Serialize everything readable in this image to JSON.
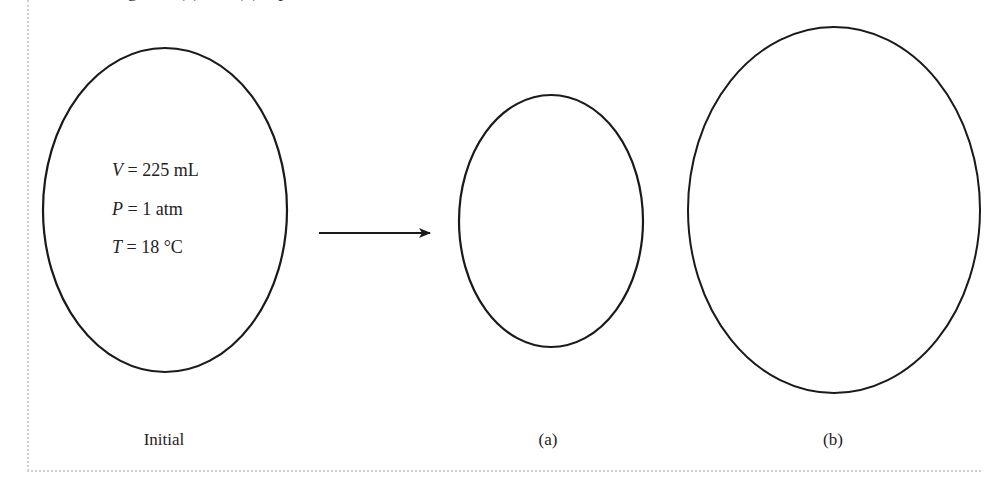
{
  "top_text_fragment": "Diagrams (a) and (b) represent",
  "initial": {
    "label": "Initial",
    "conditions": [
      {
        "var": "V",
        "rest": " = 225 mL"
      },
      {
        "var": "P",
        "rest": " = 1 atm"
      },
      {
        "var": "T",
        "rest": " = 18 °C"
      }
    ]
  },
  "arrow": {
    "direction": "right"
  },
  "options": [
    {
      "label": "(a)"
    },
    {
      "label": "(b)"
    }
  ],
  "colors": {
    "stroke": "#1a1a1a",
    "frame_dots": "#cfcfcf",
    "background": "#ffffff"
  }
}
